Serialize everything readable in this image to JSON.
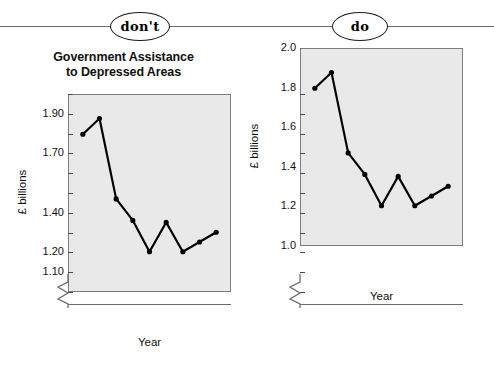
{
  "banner": {
    "dont_label": "don't",
    "do_label": "do"
  },
  "charts": [
    {
      "key": "dont",
      "title_line1": "Government Assistance",
      "title_line2": "to Depressed Areas",
      "ylabel": "£ billions",
      "xlabel": "Year",
      "ytick_labels": [
        "1.90",
        "1.70",
        "1.40",
        "1.20",
        "1.10"
      ],
      "xtick_labels": [
        "81-82",
        "83-84",
        "85-86",
        "87-88",
        "89-90"
      ]
    },
    {
      "key": "do",
      "title_line1": "Government Assistance",
      "title_line2": "to Depressed Areas",
      "ylabel": "£ billions",
      "xlabel": "Year",
      "ytick_labels": [
        "2.0",
        "1.8",
        "1.6",
        "1.4",
        "1.2",
        "1.0"
      ],
      "xtick_labels": [
        "81-82",
        "83-84",
        "85-86",
        "87-88",
        "89-90"
      ]
    }
  ],
  "chart_data": [
    {
      "type": "line",
      "title": "Government Assistance to Depressed Areas",
      "subtitle": "don't — y axis with unevenly spaced / irregular tick labels",
      "xlabel": "Year",
      "ylabel": "£ billions",
      "categories": [
        "81-82",
        "82-83",
        "83-84",
        "84-85",
        "85-86",
        "86-87",
        "87-88",
        "88-89",
        "89-90"
      ],
      "values": [
        1.8,
        1.88,
        1.47,
        1.36,
        1.2,
        1.35,
        1.2,
        1.25,
        1.3
      ],
      "ylim": [
        1.0,
        2.0
      ],
      "ytick_values": [
        1.9,
        1.7,
        1.4,
        1.2,
        1.1
      ],
      "ytick_labels": [
        "1.90",
        "1.70",
        "1.40",
        "1.20",
        "1.10"
      ],
      "irregular_y_ticks": true,
      "grid": false,
      "legend": "none",
      "axis_break": true,
      "marker": "filled-circle",
      "line_color": "#000000",
      "plot_background": "#e9e9e9"
    },
    {
      "type": "line",
      "title": "Government Assistance to Depressed Areas",
      "subtitle": "do — y axis with evenly spaced tick labels",
      "xlabel": "Year",
      "ylabel": "£ billions",
      "categories": [
        "81-82",
        "82-83",
        "83-84",
        "84-85",
        "85-86",
        "86-87",
        "87-88",
        "88-89",
        "89-90"
      ],
      "values": [
        1.8,
        1.88,
        1.47,
        1.36,
        1.2,
        1.35,
        1.2,
        1.25,
        1.3
      ],
      "ylim": [
        1.0,
        2.0
      ],
      "ytick_values": [
        2.0,
        1.8,
        1.6,
        1.4,
        1.2,
        1.0
      ],
      "ytick_labels": [
        "2.0",
        "1.8",
        "1.6",
        "1.4",
        "1.2",
        "1.0"
      ],
      "irregular_y_ticks": false,
      "grid": false,
      "legend": "none",
      "axis_break": true,
      "marker": "filled-circle",
      "line_color": "#000000",
      "plot_background": "#e9e9e9"
    }
  ]
}
